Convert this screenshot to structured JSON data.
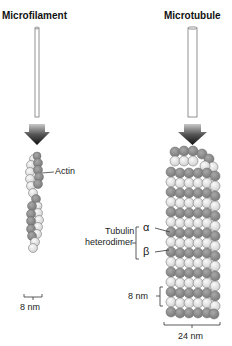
{
  "panels": {
    "microfilament": {
      "title": "Microfilament",
      "label_actin": "Actin",
      "width_label": "8 nm"
    },
    "microtubule": {
      "title": "Microtubule",
      "label_tubulin_line1": "Tubulin",
      "label_tubulin_line2": "heterodimer",
      "alpha": "α",
      "beta": "β",
      "height_label": "8 nm",
      "width_label": "24 nm"
    }
  },
  "colors": {
    "light_subunit": "#e6e6e6",
    "dark_subunit": "#8f8f8f",
    "outline": "#555555",
    "arrow_top": "#bdbdbd",
    "arrow_bottom": "#1a1a1a"
  }
}
